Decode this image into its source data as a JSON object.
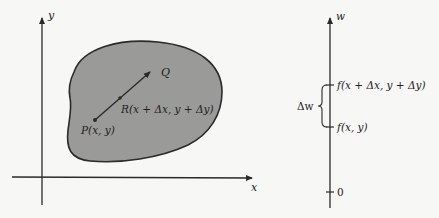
{
  "left_panel": {
    "x_axis_label": "x",
    "y_axis_label": "y",
    "region_fill": "#9a9a98",
    "region_stroke": "#2a2a2a",
    "point_P_label": "P(x, y)",
    "point_R_label": "R(x + Δx, y + Δy)",
    "point_Q_label": "Q"
  },
  "right_panel": {
    "w_axis_label": "w",
    "tick_upper_label": "f(x + Δx, y + Δy)",
    "tick_lower_label": "f(x, y)",
    "tick_zero_label": "0",
    "brace_label": "Δw"
  },
  "colors": {
    "background": "#f7f7f5",
    "ink": "#2a2a2a"
  }
}
